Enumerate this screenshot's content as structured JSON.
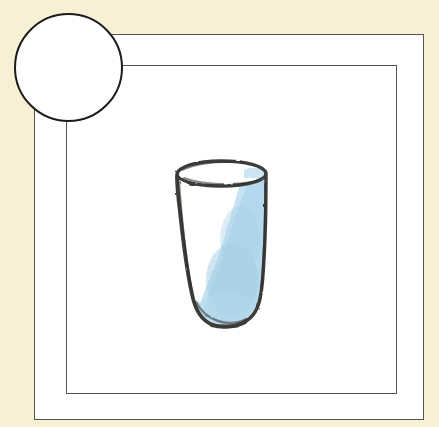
{
  "canvas": {
    "width": 439,
    "height": 427
  },
  "background": {
    "label": "cream paper background",
    "color": "#f7f0d4"
  },
  "card": {
    "label": "white illustration card",
    "fill": "#ffffff",
    "border_color": "#55544e",
    "outer_frame": {
      "x": 34,
      "y": 34,
      "width": 390,
      "height": 386
    },
    "inner_frame": {
      "x": 66,
      "y": 65,
      "width": 331,
      "height": 329
    }
  },
  "circle_badge": {
    "label": "empty white circle overlapping top-left corner",
    "cx": 68,
    "cy": 68,
    "r": 54,
    "fill": "#ffffff",
    "stroke": "#1d1c1a",
    "stroke_width": 2.6
  },
  "illustration": {
    "subject": "drinking glass",
    "style": "hand-drawn pencil sketch with colored-pencil shading",
    "outline_color": "#3a3a38",
    "shading_color": "#bcdcef",
    "shading_color_dark": "#a3cde4",
    "bounds": {
      "x": 172,
      "y": 160,
      "width": 100,
      "height": 170
    },
    "rim": {
      "cx": 221,
      "cy": 173,
      "rx": 45,
      "ry": 11
    },
    "parts": [
      {
        "name": "rim-ellipse",
        "description": "elliptical opening at top of glass"
      },
      {
        "name": "glass-body",
        "description": "tapered tumbler body with rounded bottom"
      },
      {
        "name": "liquid-shading",
        "description": "pale blue diagonal band of shading on right side widening toward base"
      }
    ]
  }
}
